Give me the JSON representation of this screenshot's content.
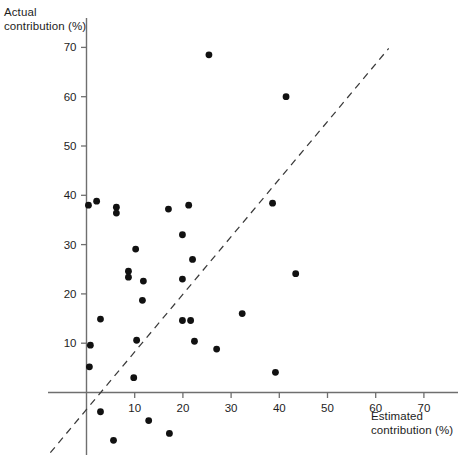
{
  "chart_data": {
    "type": "scatter",
    "title": "",
    "xlabel": "Estimated contribution (%)",
    "ylabel": "Actual contribution (%)",
    "xlim": [
      -9,
      78
    ],
    "ylim": [
      -14,
      74
    ],
    "grid": false,
    "legend": null,
    "xticks": [
      10,
      20,
      30,
      40,
      50,
      60,
      70
    ],
    "yticks": [
      10,
      20,
      30,
      40,
      50,
      60,
      70
    ],
    "xtick_labels": [
      "10",
      "20",
      "30",
      "40",
      "50",
      "60",
      "70"
    ],
    "ytick_labels": [
      "10",
      "20",
      "30",
      "40",
      "50",
      "60",
      "70"
    ],
    "marker": "filled-circle",
    "marker_color": "#111111",
    "marker_size": 4.6,
    "axis_color": "#6f6f6f",
    "reference_line": {
      "label": "identity line (y = x)",
      "style": "dashed",
      "color": "#3a3a3a",
      "x_start": -7.5,
      "y_start": -12.2,
      "x_end": 62.7,
      "y_end": 69.8
    },
    "points": [
      {
        "x": 0.4,
        "y": 38.0
      },
      {
        "x": 2.1,
        "y": 38.8
      },
      {
        "x": 6.2,
        "y": 37.6
      },
      {
        "x": 6.2,
        "y": 36.4
      },
      {
        "x": 17.0,
        "y": 37.2
      },
      {
        "x": 21.2,
        "y": 38.0
      },
      {
        "x": 25.4,
        "y": 68.5
      },
      {
        "x": 41.4,
        "y": 60.0
      },
      {
        "x": 38.6,
        "y": 38.4
      },
      {
        "x": 43.4,
        "y": 24.1
      },
      {
        "x": 10.2,
        "y": 29.1
      },
      {
        "x": 8.7,
        "y": 24.6
      },
      {
        "x": 8.7,
        "y": 23.4
      },
      {
        "x": 11.8,
        "y": 22.6
      },
      {
        "x": 19.9,
        "y": 32.0
      },
      {
        "x": 22.0,
        "y": 27.0
      },
      {
        "x": 19.9,
        "y": 23.0
      },
      {
        "x": 11.6,
        "y": 18.7
      },
      {
        "x": 2.9,
        "y": 14.9
      },
      {
        "x": 19.9,
        "y": 14.6
      },
      {
        "x": 21.6,
        "y": 14.6
      },
      {
        "x": 10.4,
        "y": 10.6
      },
      {
        "x": 22.4,
        "y": 10.4
      },
      {
        "x": 0.8,
        "y": 9.6
      },
      {
        "x": 27.0,
        "y": 8.8
      },
      {
        "x": 0.6,
        "y": 5.2
      },
      {
        "x": 32.3,
        "y": 16.0
      },
      {
        "x": 9.8,
        "y": 3.0
      },
      {
        "x": 39.2,
        "y": 4.1
      },
      {
        "x": 2.9,
        "y": -3.9
      },
      {
        "x": 12.9,
        "y": -5.7
      },
      {
        "x": 5.6,
        "y": -9.7
      },
      {
        "x": 17.2,
        "y": -8.3
      }
    ]
  },
  "labels": {
    "y_axis_title": "Actual\ncontribution (%)",
    "x_axis_title": "Estimated\ncontribution (%)"
  }
}
